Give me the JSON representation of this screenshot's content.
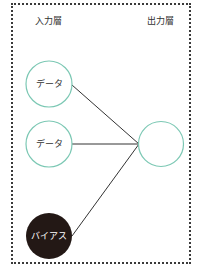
{
  "diagram": {
    "input_layer_label": "入力層",
    "output_layer_label": "出力層",
    "nodes": [
      {
        "id": "in1",
        "label": "データ",
        "type": "input"
      },
      {
        "id": "in2",
        "label": "データ",
        "type": "input"
      },
      {
        "id": "bias",
        "label": "バイアス",
        "type": "bias"
      },
      {
        "id": "out",
        "label": "",
        "type": "output"
      }
    ],
    "edges": [
      [
        "in1",
        "out"
      ],
      [
        "in2",
        "out"
      ],
      [
        "bias",
        "out"
      ]
    ],
    "colors": {
      "node_stroke": "#7cc8b4",
      "bias_fill": "#231815",
      "edge": "#333333",
      "border": "#3a3a3a"
    }
  }
}
